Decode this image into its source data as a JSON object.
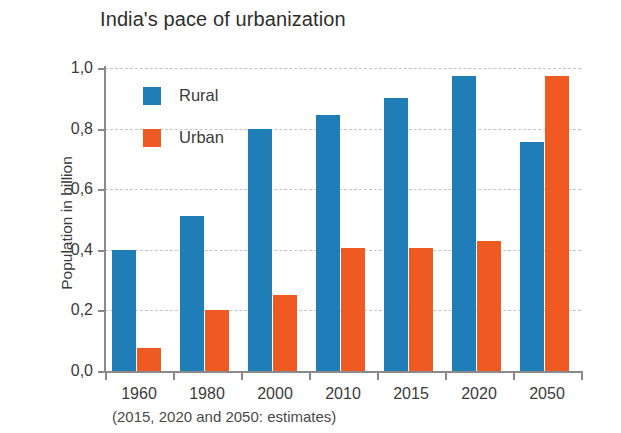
{
  "chart_data": {
    "type": "bar",
    "title": "India's pace of urbanization",
    "xlabel": "",
    "ylabel": "Population in billion",
    "categories": [
      "1960",
      "1980",
      "2000",
      "2010",
      "2015",
      "2020",
      "2050"
    ],
    "series": [
      {
        "name": "Rural",
        "color": "#1f7eb8",
        "values": [
          0.4,
          0.51,
          0.8,
          0.845,
          0.9,
          0.975,
          0.755
        ]
      },
      {
        "name": "Urban",
        "color": "#ef5a23",
        "values": [
          0.075,
          0.2,
          0.25,
          0.405,
          0.405,
          0.43,
          0.975
        ]
      }
    ],
    "ylim": [
      0,
      1.0
    ],
    "ytick_values": [
      0.0,
      0.2,
      0.4,
      0.6,
      0.8,
      1.0
    ],
    "ytick_labels": [
      "0,0",
      "0,2",
      "0,4",
      "0,6",
      "0,8",
      "1,0"
    ],
    "grid": true,
    "grid_axis": "y",
    "legend_position": "upper-left-inside",
    "annotation": "(2015, 2020 and 2050: estimates)"
  },
  "colors": {
    "rural": "#1f7eb8",
    "urban": "#ef5a23",
    "axis": "#8a8a8a",
    "grid": "#c4c4c4",
    "text": "#3b3b3b",
    "background": "#ffffff"
  }
}
